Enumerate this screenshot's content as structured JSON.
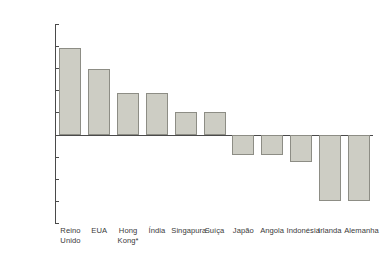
{
  "chart_data": {
    "type": "bar",
    "title": "",
    "subtitle": "",
    "xlabel": "",
    "ylabel": "",
    "ylim": [
      -20000,
      25000
    ],
    "ytick_step": 5000,
    "grid": false,
    "legend": "none",
    "number_format": "thousands separator: period (pt-BR)",
    "minus_sign": "–",
    "yticks": [
      {
        "value": 25000,
        "label": "25.000"
      },
      {
        "value": 20000,
        "label": "20.000"
      },
      {
        "value": 15000,
        "label": "15.000"
      },
      {
        "value": 10000,
        "label": "10.000"
      },
      {
        "value": 5000,
        "label": "5.000"
      },
      {
        "value": 0,
        "label": "0"
      },
      {
        "value": -5000,
        "label": "–5.000"
      },
      {
        "value": -10000,
        "label": "–10.000"
      },
      {
        "value": -15000,
        "label": "–15.000"
      },
      {
        "value": -20000,
        "label": "–20.000"
      }
    ],
    "categories": [
      "Reino\nUnido",
      "EUA",
      "Hong\nKong*",
      "Índia",
      "Singapura",
      "Suíça",
      "Japão",
      "Angola",
      "Indonésia",
      "Irlanda",
      "Alemanha"
    ],
    "values": [
      19500,
      14800,
      9300,
      9300,
      5000,
      5000,
      -4700,
      -4700,
      -6200,
      -15000,
      -15000
    ],
    "bar_color": "#cdcdc4",
    "bar_edge_color": "#8d8d85",
    "axis_color": "#4a4a4a",
    "text_color": "#3a3a3a",
    "background": "#ffffff",
    "footnote_marker": "*"
  }
}
